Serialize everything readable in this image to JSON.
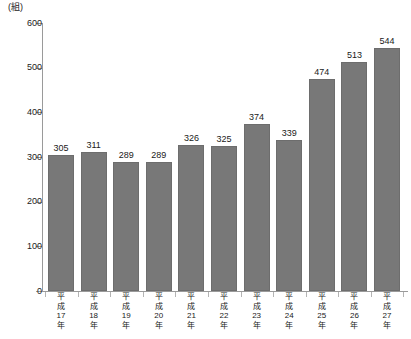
{
  "chart_data": {
    "type": "bar",
    "title": "",
    "subtitle": "",
    "unit_label": "(組)",
    "xlabel": "",
    "ylabel": "",
    "ylim": [
      0,
      600
    ],
    "y_ticks": [
      0,
      100,
      200,
      300,
      400,
      500,
      600
    ],
    "grid": false,
    "legend": null,
    "bar_color": "#787878",
    "axis_color": "#9a9a9a",
    "text_color": "#1a1a1a",
    "categories": [
      "平成17年",
      "平成18年",
      "平成19年",
      "平成20年",
      "平成21年",
      "平成22年",
      "平成23年",
      "平成24年",
      "平成25年",
      "平成26年",
      "平成27年"
    ],
    "category_lines": [
      [
        "平",
        "成",
        "17",
        "年"
      ],
      [
        "平",
        "成",
        "18",
        "年"
      ],
      [
        "平",
        "成",
        "19",
        "年"
      ],
      [
        "平",
        "成",
        "20",
        "年"
      ],
      [
        "平",
        "成",
        "21",
        "年"
      ],
      [
        "平",
        "成",
        "22",
        "年"
      ],
      [
        "平",
        "成",
        "23",
        "年"
      ],
      [
        "平",
        "成",
        "24",
        "年"
      ],
      [
        "平",
        "成",
        "25",
        "年"
      ],
      [
        "平",
        "成",
        "26",
        "年"
      ],
      [
        "平",
        "成",
        "27",
        "年"
      ]
    ],
    "values": [
      305,
      311,
      289,
      289,
      326,
      325,
      374,
      339,
      474,
      513,
      544
    ],
    "value_labels": [
      "305",
      "311",
      "289",
      "289",
      "326",
      "325",
      "374",
      "339",
      "474",
      "513",
      "544"
    ]
  }
}
